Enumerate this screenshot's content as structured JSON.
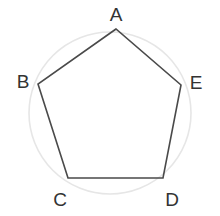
{
  "figure": {
    "kind": "inscribed-regular-pentagon",
    "canvas": {
      "width": 220,
      "height": 216,
      "background": "#ffffff"
    },
    "circle": {
      "name": "circumscribed-circle",
      "cx": 110,
      "cy": 113,
      "r": 81,
      "stroke": "#e6e6e6",
      "stroke_width": 1.6,
      "fill": "none"
    },
    "polygon": {
      "name": "pentagon",
      "sides": 5,
      "stroke": "#4a4a4a",
      "stroke_width": 1.6,
      "fill": "none",
      "points": "116,29 38,84 68,178 163,178 181,85",
      "edges": [
        "AB",
        "BC",
        "CD",
        "DE",
        "EA"
      ]
    },
    "vertices": [
      {
        "id": "A",
        "label": "A",
        "x": 116,
        "y": 29,
        "label_x": 116,
        "label_y": 14
      },
      {
        "id": "B",
        "label": "B",
        "x": 38,
        "y": 84,
        "label_x": 23,
        "label_y": 81
      },
      {
        "id": "C",
        "label": "C",
        "x": 68,
        "y": 178,
        "label_x": 60,
        "label_y": 199
      },
      {
        "id": "D",
        "label": "D",
        "x": 163,
        "y": 178,
        "label_x": 172,
        "label_y": 199
      },
      {
        "id": "E",
        "label": "E",
        "x": 181,
        "y": 85,
        "label_x": 196,
        "label_y": 82
      }
    ],
    "label_style": {
      "color": "#333333",
      "font_size_px": 19
    }
  }
}
